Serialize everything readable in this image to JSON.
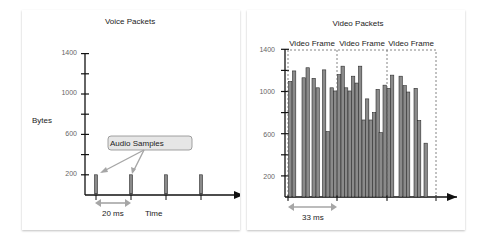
{
  "chart_data": [
    {
      "type": "bar",
      "title": "Voice Packets",
      "ylabel": "Bytes",
      "xlabel": "Time",
      "ylim": [
        0,
        1400
      ],
      "yticks": [
        200,
        600,
        1000,
        1400
      ],
      "x": [
        1,
        2,
        3,
        4
      ],
      "values": [
        200,
        200,
        200,
        200
      ],
      "annotations": [
        {
          "text": "Audio Samples",
          "points_to": [
            1,
            2
          ]
        },
        {
          "text": "20 ms",
          "type": "interval",
          "between": [
            1,
            2
          ]
        }
      ],
      "grid": false
    },
    {
      "type": "bar",
      "title": "Video Packets",
      "ylabel": "",
      "xlabel": "",
      "ylim": [
        0,
        1400
      ],
      "yticks": [
        200,
        600,
        1000,
        1400
      ],
      "frames": [
        "Video Frame",
        "Video Frame",
        "Video Frame"
      ],
      "values": [
        1095,
        1195,
        1130,
        1225,
        1125,
        1035,
        1205,
        620,
        1035,
        1005,
        1160,
        1240,
        1035,
        1005,
        1145,
        1080,
        1240,
        730,
        930,
        730,
        800,
        1020,
        610,
        1060,
        1030,
        1155,
        1145,
        1055,
        995,
        1030,
        725,
        510
      ],
      "annotations": [
        {
          "text": "33 ms",
          "type": "interval",
          "between": [
            "frame1_start",
            "frame2_start"
          ]
        }
      ],
      "grid": false
    }
  ],
  "voice": {
    "title": "Voice Packets",
    "ylabel": "Bytes",
    "xlabel": "Time",
    "callout": "Audio Samples",
    "interval": "20 ms",
    "yticks": [
      "1400",
      "1000",
      "600",
      "200"
    ]
  },
  "video": {
    "title": "Video Packets",
    "frame_label": "Video Frame",
    "interval": "33 ms",
    "yticks": [
      "1400",
      "1000",
      "600",
      "200"
    ]
  },
  "colors": {
    "bar": "#8a8a8a",
    "bar_stroke": "#2b2b2b",
    "axis": "#111111",
    "arrow": "#a6a6a6",
    "callout_fill": "#e6e6e6"
  }
}
